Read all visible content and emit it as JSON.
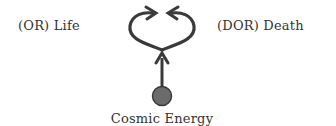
{
  "diagram": {
    "type": "energy-flow",
    "labels": {
      "left": "(OR)  Life",
      "right": "(DOR)  Death",
      "source": "Cosmic Energy"
    },
    "nodes": [
      {
        "id": "source",
        "label": "Cosmic Energy",
        "shape": "circle",
        "fill": "#6b6b6b"
      },
      {
        "id": "left",
        "label": "(OR) Life"
      },
      {
        "id": "right",
        "label": "(DOR) Death"
      }
    ],
    "edges": [
      {
        "from": "source",
        "to": "junction",
        "style": "arrow"
      },
      {
        "from": "junction",
        "to": "left",
        "style": "curved-arrow"
      },
      {
        "from": "junction",
        "to": "right",
        "style": "curved-arrow"
      }
    ],
    "colors": {
      "stroke": "#3a3a3a",
      "circle_fill": "#6b6b6b",
      "text": "#333333",
      "background": "#ffffff"
    }
  }
}
